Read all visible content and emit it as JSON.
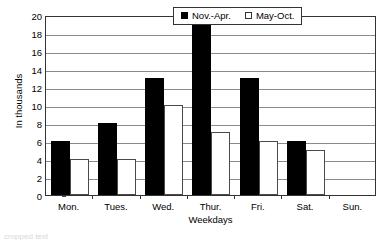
{
  "chart_data": {
    "type": "bar",
    "title": "",
    "subtitle": "",
    "xlabel": "Weekdays",
    "ylabel": "In thousands",
    "categories": [
      "Mon.",
      "Tues.",
      "Wed.",
      "Thur.",
      "Fri.",
      "Sat.",
      "Sun."
    ],
    "series": [
      {
        "name": "Nov.-Apr.",
        "color": "#000000",
        "values": [
          6,
          8,
          13,
          19,
          13,
          6,
          0
        ]
      },
      {
        "name": "May-Oct.",
        "color": "#ffffff",
        "values": [
          4,
          4,
          10,
          7,
          6,
          5,
          0
        ]
      }
    ],
    "ylim": [
      0,
      20
    ],
    "ytick_step": 2,
    "yticks": [
      0,
      2,
      4,
      6,
      8,
      10,
      12,
      14,
      16,
      18,
      20
    ],
    "ytick_labels": [
      "0",
      "2",
      "4",
      "6",
      "8",
      "10",
      "12",
      "14",
      "16",
      "18",
      "20"
    ],
    "grid": "horizontal",
    "grid_color": "#8a8a8a",
    "legend_position": "top-right-inside",
    "legend_entries": [
      "Nov.-Apr.",
      "May-Oct."
    ],
    "axis_color": "#333333",
    "plot_background": "#ffffff"
  },
  "caption_sliver": "cropped text"
}
